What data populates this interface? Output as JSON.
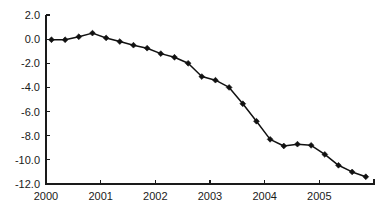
{
  "chart_data": {
    "type": "line",
    "title": "",
    "subtitle": "",
    "xlabel": "",
    "ylabel": "",
    "xlim": [
      2000.0,
      2006.0
    ],
    "ylim": [
      -12.0,
      2.0
    ],
    "grid": false,
    "legend": null,
    "marker": "diamond",
    "line_color": "#111111",
    "marker_color": "#111111",
    "background_color": "#ffffff",
    "x_tick_labels": [
      "2000",
      "2001",
      "2002",
      "2003",
      "2004",
      "2005"
    ],
    "x_ticks": [
      2000,
      2001,
      2002,
      2003,
      2004,
      2005
    ],
    "y_tick_labels": [
      "2.0",
      "0.0",
      "-2.0",
      "-4.0",
      "-6.0",
      "-8.0",
      "-10.0",
      "-12.0"
    ],
    "y_ticks": [
      2.0,
      0.0,
      -2.0,
      -4.0,
      -6.0,
      -8.0,
      -10.0,
      -12.0
    ],
    "x": [
      2000.1,
      2000.35,
      2000.6,
      2000.85,
      2001.1,
      2001.35,
      2001.6,
      2001.85,
      2002.1,
      2002.35,
      2002.6,
      2002.85,
      2003.1,
      2003.35,
      2003.6,
      2003.85,
      2004.1,
      2004.35,
      2004.6,
      2004.85,
      2005.1,
      2005.35,
      2005.6,
      2005.85
    ],
    "values": [
      -0.05,
      -0.05,
      0.2,
      0.5,
      0.1,
      -0.2,
      -0.5,
      -0.75,
      -1.2,
      -1.5,
      -2.0,
      -3.1,
      -3.4,
      -4.0,
      -5.35,
      -6.8,
      -8.3,
      -8.85,
      -8.7,
      -8.8,
      -9.55,
      -10.45,
      -11.0,
      -11.4
    ],
    "series": [
      {
        "name": "series-1",
        "values": [
          -0.05,
          -0.05,
          0.2,
          0.5,
          0.1,
          -0.2,
          -0.5,
          -0.75,
          -1.2,
          -1.5,
          -2.0,
          -3.1,
          -3.4,
          -4.0,
          -5.35,
          -6.8,
          -8.3,
          -8.85,
          -8.7,
          -8.8,
          -9.55,
          -10.45,
          -11.0,
          -11.4
        ]
      }
    ]
  }
}
